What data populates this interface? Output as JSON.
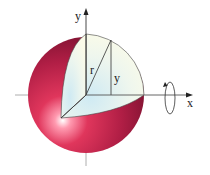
{
  "diagram": {
    "labels": {
      "y_axis": "y",
      "x_axis": "x",
      "radius": "r",
      "height": "y"
    },
    "colors": {
      "sphere_dark": "#7a1030",
      "sphere_mid": "#b01e45",
      "sphere_light": "#e03a60",
      "highlight": "#ffffff",
      "cut_face": "#f4f8ea",
      "cut_face_blue": "#d6eef5",
      "axis": "#888888",
      "line": "#333333"
    }
  }
}
